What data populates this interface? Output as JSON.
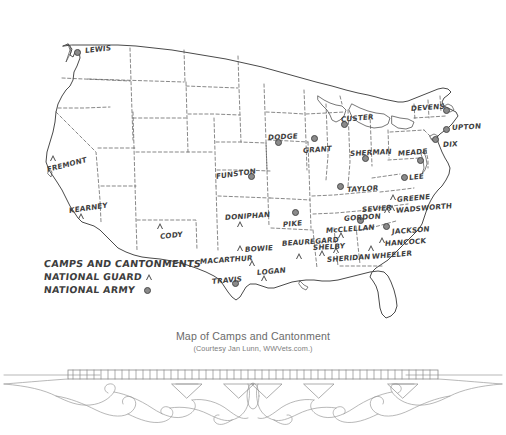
{
  "figure": {
    "title": "Map of Camps and Cantonment",
    "credit": "(Courtesy Jan Lunn, WWVets.com.)"
  },
  "legend": {
    "title": "CAMPS AND CANTONMENTS",
    "items": [
      {
        "label": "NATIONAL GUARD",
        "symbol": "triangle-outline"
      },
      {
        "label": "NATIONAL ARMY",
        "symbol": "filled-circle"
      }
    ]
  },
  "map": {
    "region": "Continental United States",
    "background_color": "#ffffff",
    "outline_color": "#4a4a4a",
    "interior_border_style": "dashed",
    "camps": [
      {
        "name": "LEWIS",
        "type": "national-army",
        "x": 77,
        "y": 52,
        "label_x": 85,
        "label_y": 47,
        "rot": -6
      },
      {
        "name": "FREMONT",
        "type": "national-guard",
        "x": 51,
        "y": 158,
        "label_x": 47,
        "label_y": 166,
        "rot": -14
      },
      {
        "name": "KEARNEY",
        "type": "national-guard",
        "x": 79,
        "y": 216,
        "label_x": 69,
        "label_y": 207,
        "rot": -8
      },
      {
        "name": "CODY",
        "type": "national-guard",
        "x": 158,
        "y": 226,
        "label_x": 160,
        "label_y": 233,
        "rot": -6
      },
      {
        "name": "FUNSTON",
        "type": "national-army",
        "x": 251,
        "y": 176,
        "label_x": 216,
        "label_y": 173,
        "rot": -8
      },
      {
        "name": "DONIPHAN",
        "type": "national-guard",
        "x": 238,
        "y": 224,
        "label_x": 225,
        "label_y": 214,
        "rot": -4
      },
      {
        "name": "DODGE",
        "type": "national-army",
        "x": 278,
        "y": 142,
        "label_x": 268,
        "label_y": 134,
        "rot": -3
      },
      {
        "name": "GRANT",
        "type": "national-army",
        "x": 314,
        "y": 138,
        "label_x": 303,
        "label_y": 147,
        "rot": -4
      },
      {
        "name": "CUSTER",
        "type": "national-army",
        "x": 344,
        "y": 124,
        "label_x": 341,
        "label_y": 116,
        "rot": -5
      },
      {
        "name": "SHERMAN",
        "type": "national-army",
        "x": 365,
        "y": 158,
        "label_x": 350,
        "label_y": 150,
        "rot": -3
      },
      {
        "name": "TAYLOR",
        "type": "national-army",
        "x": 340,
        "y": 186,
        "label_x": 347,
        "label_y": 186,
        "rot": -3
      },
      {
        "name": "DEVENS",
        "type": "national-army",
        "x": 446,
        "y": 110,
        "label_x": 411,
        "label_y": 105,
        "rot": -4
      },
      {
        "name": "UPTON",
        "type": "national-army",
        "x": 446,
        "y": 129,
        "label_x": 452,
        "label_y": 124,
        "rot": -3
      },
      {
        "name": "DIX",
        "type": "national-army",
        "x": 435,
        "y": 139,
        "label_x": 443,
        "label_y": 141,
        "rot": -3
      },
      {
        "name": "MEADE",
        "type": "national-army",
        "x": 420,
        "y": 160,
        "label_x": 398,
        "label_y": 150,
        "rot": -5
      },
      {
        "name": "LEE",
        "type": "national-army",
        "x": 404,
        "y": 177,
        "label_x": 409,
        "label_y": 174,
        "rot": -6
      },
      {
        "name": "PIKE",
        "type": "national-army",
        "x": 295,
        "y": 212,
        "label_x": 283,
        "label_y": 221,
        "rot": -5
      },
      {
        "name": "BEAUREGARD",
        "type": "national-guard",
        "x": 297,
        "y": 256,
        "label_x": 282,
        "label_y": 240,
        "rot": -4
      },
      {
        "name": "SHELBY",
        "type": "national-guard",
        "x": 320,
        "y": 253,
        "label_x": 313,
        "label_y": 244,
        "rot": -3
      },
      {
        "name": "BOWIE",
        "type": "national-guard",
        "x": 238,
        "y": 248,
        "label_x": 245,
        "label_y": 246,
        "rot": -4
      },
      {
        "name": "MACARTHUR",
        "type": "national-guard",
        "x": 250,
        "y": 263,
        "label_x": 200,
        "label_y": 258,
        "rot": -4
      },
      {
        "name": "TRAVIS",
        "type": "national-army",
        "x": 235,
        "y": 283,
        "label_x": 212,
        "label_y": 278,
        "rot": -5
      },
      {
        "name": "LOGAN",
        "type": "national-guard",
        "x": 262,
        "y": 278,
        "label_x": 257,
        "label_y": 269,
        "rot": -5
      },
      {
        "name": "McCLELLAN",
        "type": "national-guard",
        "x": 339,
        "y": 235,
        "label_x": 326,
        "label_y": 227,
        "rot": -4
      },
      {
        "name": "SHERIDAN",
        "type": "national-guard",
        "x": 334,
        "y": 250,
        "label_x": 327,
        "label_y": 256,
        "rot": -4
      },
      {
        "name": "GORDON",
        "type": "national-army",
        "x": 360,
        "y": 220,
        "label_x": 344,
        "label_y": 215,
        "rot": -4
      },
      {
        "name": "SEVIER",
        "type": "national-guard",
        "x": 385,
        "y": 210,
        "label_x": 362,
        "label_y": 206,
        "rot": -4
      },
      {
        "name": "WADSWORTH",
        "type": "national-guard",
        "x": 390,
        "y": 208,
        "label_x": 396,
        "label_y": 207,
        "rot": -5
      },
      {
        "name": "GREENE",
        "type": "national-guard",
        "x": 391,
        "y": 197,
        "label_x": 397,
        "label_y": 196,
        "rot": -5
      },
      {
        "name": "JACKSON",
        "type": "national-army",
        "x": 386,
        "y": 226,
        "label_x": 392,
        "label_y": 228,
        "rot": -4
      },
      {
        "name": "HANCOCK",
        "type": "national-guard",
        "x": 380,
        "y": 240,
        "label_x": 385,
        "label_y": 240,
        "rot": -4
      },
      {
        "name": "WHEELER",
        "type": "national-guard",
        "x": 369,
        "y": 248,
        "label_x": 372,
        "label_y": 253,
        "rot": -5
      }
    ]
  }
}
